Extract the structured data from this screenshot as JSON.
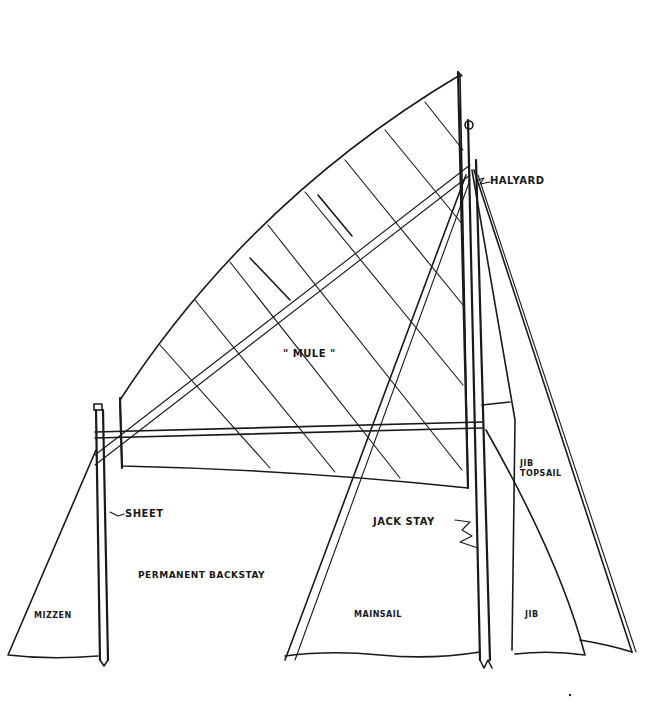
{
  "diagram": {
    "type": "sail-rig-line-drawing",
    "colors": {
      "ink": "#1a1a1a",
      "paper": "#ffffff"
    },
    "labels": {
      "halyard": "HALYARD",
      "mule": "\" MULE \"",
      "sheet": "SHEET",
      "jack_stay": "JACK STAY",
      "permanent_backstay": "PERMANENT BACKSTAY",
      "jib_topsail_line1": "JIB",
      "jib_topsail_line2": "TOPSAIL",
      "mizzen": "MIZZEN",
      "mainsail": "MAINSAIL",
      "jib": "JIB"
    }
  }
}
